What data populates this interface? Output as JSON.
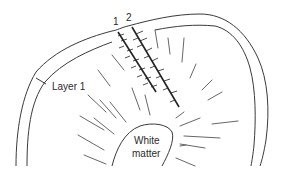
{
  "diagram": {
    "labels": {
      "track_1": "1",
      "track_2": "2",
      "layer": "Layer 1",
      "white_matter_line1": "White",
      "white_matter_line2": "matter"
    },
    "colors": {
      "line": "#3a3a3a",
      "track": "#222222",
      "background": "#ffffff"
    }
  }
}
